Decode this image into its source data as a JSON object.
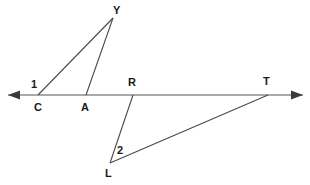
{
  "figure": {
    "canvas": {
      "width": 310,
      "height": 185,
      "background": "#ffffff"
    },
    "colors": {
      "line": "#8c8c8c",
      "segment": "#4a4a4a",
      "arrow": "#3a3a3a",
      "label": "#1a1a1a"
    },
    "transversal": {
      "name": "horizontal-line",
      "y": 95,
      "x_start": 8,
      "x_end": 303,
      "arrow_left": true,
      "arrow_right": true
    },
    "points": [
      {
        "id": "C",
        "label": "C",
        "x": 38,
        "y": 95,
        "label_x": 34,
        "label_y": 102
      },
      {
        "id": "A",
        "label": "A",
        "x": 86,
        "y": 95,
        "label_x": 81,
        "label_y": 102
      },
      {
        "id": "R",
        "label": "R",
        "x": 133,
        "y": 95,
        "label_x": 128,
        "label_y": 77
      },
      {
        "id": "T",
        "label": "T",
        "x": 268,
        "y": 95,
        "label_x": 263,
        "label_y": 77
      },
      {
        "id": "Y",
        "label": "Y",
        "x": 113,
        "y": 18,
        "label_x": 113,
        "label_y": 5
      },
      {
        "id": "L",
        "label": "L",
        "x": 110,
        "y": 163,
        "label_x": 105,
        "label_y": 168
      }
    ],
    "segments": [
      {
        "name": "segment-Y-C",
        "from": "Y",
        "to": "C",
        "x1": 113,
        "y1": 18,
        "x2": 38,
        "y2": 95
      },
      {
        "name": "segment-Y-A",
        "from": "Y",
        "to": "A",
        "x1": 113,
        "y1": 18,
        "x2": 86,
        "y2": 95
      },
      {
        "name": "segment-R-L",
        "from": "R",
        "to": "L",
        "x1": 133,
        "y1": 95,
        "x2": 110,
        "y2": 163
      },
      {
        "name": "segment-L-T",
        "from": "L",
        "to": "T",
        "x1": 110,
        "y1": 163,
        "x2": 268,
        "y2": 95
      }
    ],
    "angle_marks": [
      {
        "id": "1",
        "label": "1",
        "at_vertex": "C",
        "label_x": 31,
        "label_y": 79
      },
      {
        "id": "2",
        "label": "2",
        "at_vertex": "L",
        "label_x": 117,
        "label_y": 145
      }
    ]
  }
}
